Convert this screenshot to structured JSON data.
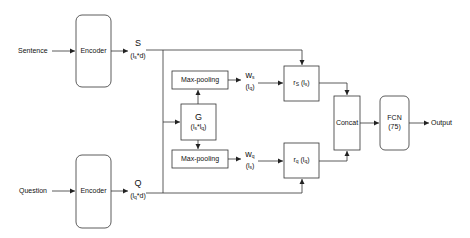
{
  "diagram": {
    "inputs": {
      "sentence": "Sentence",
      "question": "Question"
    },
    "encoders": {
      "top": "Encoder",
      "bottom": "Encoder"
    },
    "encoder_outputs": {
      "s_symbol": "S",
      "s_dim_l": "(l",
      "s_dim_sub": "s",
      "s_dim_r": "*d)",
      "q_symbol": "Q",
      "q_dim_l": "(l",
      "q_dim_sub": "q",
      "q_dim_r": "*d)"
    },
    "g_box": {
      "symbol": "G",
      "dim_l": "(l",
      "dim_sub1": "s",
      "dim_mid": "*l",
      "dim_sub2": "q",
      "dim_r": ")"
    },
    "pooling": {
      "top": "Max-pooling",
      "bottom": "Max-pooling"
    },
    "weights": {
      "ws_symbol": "w",
      "ws_sub": "s",
      "ws_dim_l": "(l",
      "ws_dim_sub": "q",
      "ws_dim_r": ")",
      "wq_symbol": "w",
      "wq_sub": "q",
      "wq_dim_l": "(l",
      "wq_dim_sub": "s",
      "wq_dim_r": ")"
    },
    "representations": {
      "rs_symbol": "r",
      "rs_sub": "S",
      "rs_dim_l": " (l",
      "rs_dim_sub": "s",
      "rs_dim_r": ")",
      "rq_symbol": "r",
      "rq_sub": "q",
      "rq_dim_l": " (l",
      "rq_dim_sub": "q",
      "rq_dim_r": ")"
    },
    "concat": "Concat",
    "fcn": {
      "name": "FCN",
      "units": "(75)"
    },
    "output": "Output",
    "colors": {
      "stroke": "#333333",
      "background": "#ffffff"
    }
  }
}
